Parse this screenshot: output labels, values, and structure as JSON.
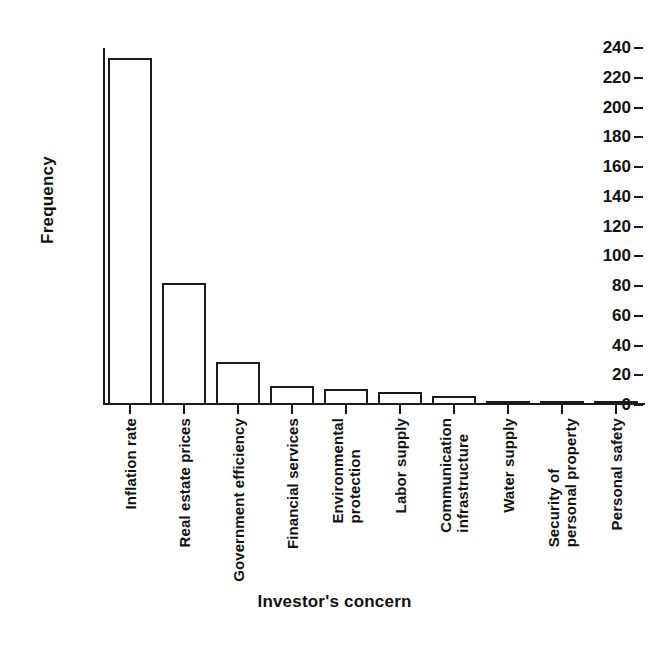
{
  "chart_data": {
    "type": "bar",
    "title": "",
    "xlabel": "Investor's concern",
    "ylabel": "Frequency",
    "categories": [
      "Inflation rate",
      "Real estate prices",
      "Government efficiency",
      "Financial services",
      "Environmental protection",
      "Labor supply",
      "Communication infrastructure",
      "Water supply",
      "Security of personal property",
      "Personal safety"
    ],
    "category_lines": [
      [
        "Inflation rate"
      ],
      [
        "Real estate prices"
      ],
      [
        "Government efficiency"
      ],
      [
        "Financial services"
      ],
      [
        "Environmental",
        "protection"
      ],
      [
        "Labor supply"
      ],
      [
        "Communication",
        "infrastructure"
      ],
      [
        "Water supply"
      ],
      [
        "Security of",
        "personal property"
      ],
      [
        "Personal safety"
      ]
    ],
    "values": [
      233,
      82,
      29,
      13,
      11,
      9,
      6,
      3,
      2,
      1
    ],
    "ylim": [
      0,
      240
    ],
    "ytick_values": [
      0,
      20,
      40,
      60,
      80,
      100,
      120,
      140,
      160,
      180,
      200,
      220,
      240
    ],
    "ytick_labels": [
      "0",
      "20",
      "40",
      "60",
      "80",
      "100",
      "120",
      "140",
      "160",
      "180",
      "200",
      "220",
      "240"
    ],
    "grid": false,
    "legend": false,
    "bar_fill_color": "#ffffff",
    "bar_edge_color": "#1a1a1a",
    "axis_color": "#1a1a1a",
    "background_color": "#ffffff"
  }
}
